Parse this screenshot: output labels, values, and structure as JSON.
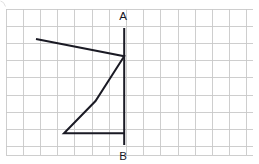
{
  "figure": {
    "canvas": {
      "width": 259,
      "height": 164,
      "background": "#ffffff"
    },
    "grid": {
      "origin_x": 6,
      "origin_y": 9,
      "cell_size": 17.2,
      "columns": 14,
      "rows": 8.5,
      "right_edge": 252.8,
      "bottom_edge": 155.2,
      "color": "#c9c9c9",
      "visible": true
    },
    "segment_ab": {
      "label_start": "A",
      "label_end": "B",
      "x": 124.2,
      "y_top": 28,
      "y_bottom": 145,
      "color": "#1a1a24",
      "stroke_width": 2.0
    },
    "labels": [
      {
        "text": "A",
        "x": 123,
        "y": 20,
        "name": "label-a"
      },
      {
        "text": "B",
        "x": 123,
        "y": 160,
        "name": "label-b"
      }
    ],
    "polyline": {
      "name": "zigzag-arrow-shape",
      "color": "#1a1a24",
      "stroke_width": 2.0,
      "points": "36,39 124.2,56.2 95.5,101 64,133.2 124.2,133.2",
      "vertices": [
        {
          "x": 36,
          "y": 39,
          "name": "vertex-top-left"
        },
        {
          "x": 124.2,
          "y": 56.2,
          "name": "vertex-right-upper"
        },
        {
          "x": 95.5,
          "y": 101,
          "name": "vertex-middle-notch"
        },
        {
          "x": 64,
          "y": 133.2,
          "name": "vertex-bottom-left"
        },
        {
          "x": 124.2,
          "y": 133.2,
          "name": "vertex-bottom-right"
        }
      ]
    },
    "corner_artifact": {
      "path": "M 0.5 1 Q 4 1.5 5.5 6.5",
      "visible": true
    }
  }
}
